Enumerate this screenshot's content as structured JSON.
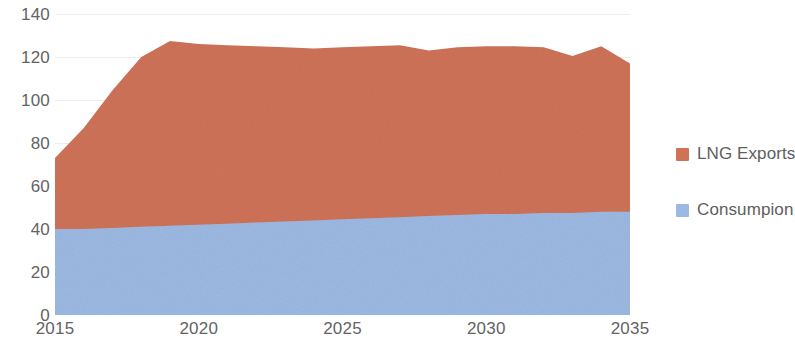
{
  "chart_data": {
    "type": "area",
    "stacked": true,
    "title": "",
    "subtitle": "",
    "xlabel": "",
    "ylabel": "",
    "grid": true,
    "legend_position": "right",
    "xlim": [
      2015,
      2035
    ],
    "ylim": [
      0,
      140
    ],
    "x_ticks": [
      "2015",
      "2020",
      "2025",
      "2030",
      "2035"
    ],
    "y_ticks": [
      "140",
      "120",
      "100",
      "80",
      "60",
      "40",
      "20",
      "0"
    ],
    "x": [
      2015,
      2016,
      2017,
      2018,
      2019,
      2020,
      2021,
      2022,
      2023,
      2024,
      2025,
      2026,
      2027,
      2028,
      2029,
      2030,
      2031,
      2032,
      2033,
      2034,
      2035
    ],
    "series": [
      {
        "name": "Consumpion",
        "color": "#9CB9E3",
        "values": [
          40,
          40,
          40.5,
          41,
          41.5,
          42,
          42.5,
          43,
          43.5,
          44,
          44.5,
          45,
          45.5,
          46,
          46.5,
          47,
          47,
          47.5,
          47.5,
          48,
          48
        ]
      },
      {
        "name": "LNG Exports",
        "color": "#CE7258",
        "values": [
          33,
          47,
          64,
          79,
          86,
          84,
          83,
          82,
          81,
          80,
          80,
          80,
          80,
          77,
          78,
          78,
          78,
          77,
          73,
          77,
          69
        ]
      }
    ],
    "totals": [
      73,
      87,
      104.5,
      120,
      127.5,
      126,
      125.5,
      125,
      124.5,
      124,
      124.5,
      125,
      125.5,
      123,
      124.5,
      125,
      125,
      124.5,
      120.5,
      125,
      117
    ]
  },
  "legend": {
    "items": [
      {
        "label": "LNG Exports",
        "color": "#CE7258",
        "swatch_name": "legend-swatch-lng-exports"
      },
      {
        "label": "Consumpion",
        "color": "#9CB9E3",
        "swatch_name": "legend-swatch-consumpion"
      }
    ]
  },
  "axes": {
    "y_labels": [
      "140",
      "120",
      "100",
      "80",
      "60",
      "40",
      "20",
      "0"
    ],
    "x_labels": [
      "2015",
      "2020",
      "2025",
      "2030",
      "2035"
    ]
  },
  "colors": {
    "series_orange": "#CE7258",
    "series_blue": "#9CB9E3",
    "axis_text": "#636363",
    "gridline": "#E8E8E8",
    "background": "#FFFFFF"
  }
}
